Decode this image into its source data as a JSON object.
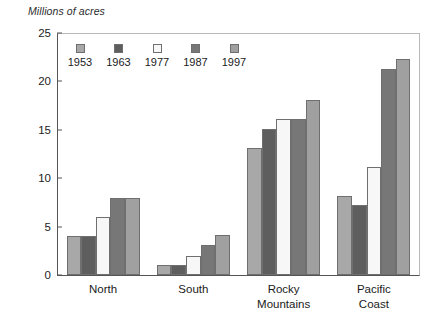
{
  "chart_data": {
    "type": "bar",
    "title": "",
    "ylabel": "Millions of acres",
    "xlabel": "",
    "ylim": [
      0,
      25
    ],
    "yticks": [
      0,
      5,
      10,
      15,
      20,
      25
    ],
    "grid": false,
    "legend_position": "top-left-inside",
    "categories": [
      "North",
      "South",
      "Rocky Mountains",
      "Pacific Coast"
    ],
    "category_lines": [
      [
        "North"
      ],
      [
        "South"
      ],
      [
        "Rocky",
        "Mountains"
      ],
      [
        "Pacific",
        "Coast"
      ]
    ],
    "series": [
      {
        "name": "1953",
        "color": "#a8a8a8",
        "values": [
          4.0,
          1.0,
          13.1,
          8.2
        ]
      },
      {
        "name": "1963",
        "color": "#5e5e5e",
        "values": [
          4.0,
          1.0,
          15.1,
          7.2
        ]
      },
      {
        "name": "1977",
        "color": "#f7f7f7",
        "values": [
          6.0,
          2.0,
          16.1,
          11.2
        ]
      },
      {
        "name": "1987",
        "color": "#777777",
        "values": [
          8.0,
          3.1,
          16.1,
          21.3
        ]
      },
      {
        "name": "1997",
        "color": "#a0a0a0",
        "values": [
          8.0,
          4.1,
          18.1,
          22.3
        ]
      }
    ]
  },
  "legend": {
    "items": [
      {
        "label": "1953",
        "color": "#a8a8a8"
      },
      {
        "label": "1963",
        "color": "#5e5e5e"
      },
      {
        "label": "1977",
        "color": "#f7f7f7"
      },
      {
        "label": "1987",
        "color": "#777777"
      },
      {
        "label": "1997",
        "color": "#a0a0a0"
      }
    ]
  }
}
